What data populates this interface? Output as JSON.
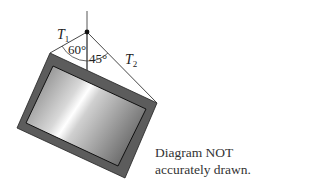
{
  "labels": {
    "t1": "T",
    "t1_sub": "1",
    "t2": "T",
    "t2_sub": "2",
    "angle1": "60°",
    "angle2": "45°"
  },
  "note": {
    "line1": "Diagram NOT",
    "line2": "accurately drawn."
  },
  "colors": {
    "frame": "#5a5a5a",
    "line": "#333333"
  }
}
